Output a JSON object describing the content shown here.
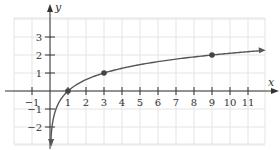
{
  "chart_data": {
    "type": "line",
    "title": "",
    "function": "y = log_3(x)",
    "xlabel": "x",
    "ylabel": "y",
    "xlim": [
      -2,
      11.8
    ],
    "ylim": [
      -2.9,
      4
    ],
    "grid": true,
    "grid_x_range": [
      -2,
      12
    ],
    "grid_y_range": [
      -3,
      4
    ],
    "x_ticks": [
      -1,
      1,
      2,
      3,
      4,
      5,
      6,
      7,
      8,
      9,
      10,
      11
    ],
    "x_tick_labels": [
      "−1",
      "1",
      "2",
      "3",
      "4",
      "5",
      "6",
      "7",
      "8",
      "9",
      "10",
      "11"
    ],
    "y_ticks": [
      3,
      2,
      1,
      -1,
      -2
    ],
    "y_tick_labels": [
      "3",
      "2",
      "1",
      "−1",
      "−2"
    ],
    "highlighted_points": [
      {
        "x": 1,
        "y": 0
      },
      {
        "x": 3,
        "y": 1
      },
      {
        "x": 9,
        "y": 2
      }
    ],
    "series": [
      {
        "name": "log3(x)",
        "x_start": 0.05,
        "x_end": 11.7,
        "arrow_both_ends": true
      }
    ]
  },
  "style": {
    "grid_color": "#e4e4e4",
    "axis_color": "#333333",
    "curve_color": "#555555",
    "point_color": "#444444"
  }
}
